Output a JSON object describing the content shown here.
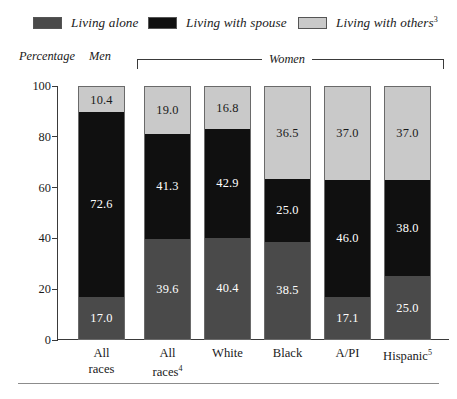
{
  "legend": {
    "items": [
      {
        "label": "Living alone",
        "color": "#4a4a4a",
        "key": "alone"
      },
      {
        "label": "Living with spouse",
        "color": "#101010",
        "key": "spouse"
      },
      {
        "label": "Living with others",
        "color": "#c9c9c9",
        "key": "others",
        "footnote": "3"
      }
    ]
  },
  "captions": {
    "ylabel": "Percentage",
    "men": "Men",
    "women": "Women"
  },
  "axis": {
    "yticks": [
      "100",
      "80",
      "60",
      "40",
      "20",
      "0"
    ]
  },
  "xlabels": [
    {
      "line1": "All",
      "line2": "races",
      "footnote": ""
    },
    {
      "line1": "All",
      "line2": "races",
      "footnote": "4"
    },
    {
      "line1": "White",
      "line2": "",
      "footnote": ""
    },
    {
      "line1": "Black",
      "line2": "",
      "footnote": ""
    },
    {
      "line1": "A/PI",
      "line2": "",
      "footnote": ""
    },
    {
      "line1": "Hispanic",
      "line2": "",
      "footnote": "5"
    }
  ],
  "bars": [
    {
      "category": "All races (Men)",
      "others": "10.4",
      "spouse": "72.6",
      "alone": "17.0"
    },
    {
      "category": "All races (Women)",
      "others": "19.0",
      "spouse": "41.3",
      "alone": "39.6"
    },
    {
      "category": "White",
      "others": "16.8",
      "spouse": "42.9",
      "alone": "40.4"
    },
    {
      "category": "Black",
      "others": "36.5",
      "spouse": "25.0",
      "alone": "38.5"
    },
    {
      "category": "A/PI",
      "others": "37.0",
      "spouse": "46.0",
      "alone": "17.1"
    },
    {
      "category": "Hispanic",
      "others": "37.0",
      "spouse": "38.0",
      "alone": "25.0"
    }
  ],
  "chart_data": {
    "type": "bar",
    "title": "",
    "xlabel": "",
    "ylabel": "Percentage",
    "ylim": [
      0,
      100
    ],
    "yticks": [
      0,
      20,
      40,
      60,
      80,
      100
    ],
    "grid": false,
    "stacked": true,
    "legend_position": "top",
    "group_labels": [
      "Men",
      "Women"
    ],
    "categories": [
      "All races",
      "All races4",
      "White",
      "Black",
      "A/PI",
      "Hispanic5"
    ],
    "series": [
      {
        "name": "Living alone",
        "color": "#4a4a4a",
        "values": [
          17.0,
          39.6,
          40.4,
          38.5,
          17.1,
          25.0
        ]
      },
      {
        "name": "Living with spouse",
        "color": "#101010",
        "values": [
          72.6,
          41.3,
          42.9,
          25.0,
          46.0,
          38.0
        ]
      },
      {
        "name": "Living with others3",
        "color": "#c9c9c9",
        "values": [
          10.4,
          19.0,
          16.8,
          36.5,
          37.0,
          37.0
        ]
      }
    ],
    "annotations": [
      "Men group covers first bar",
      "Women group covers bars 2-6"
    ]
  }
}
